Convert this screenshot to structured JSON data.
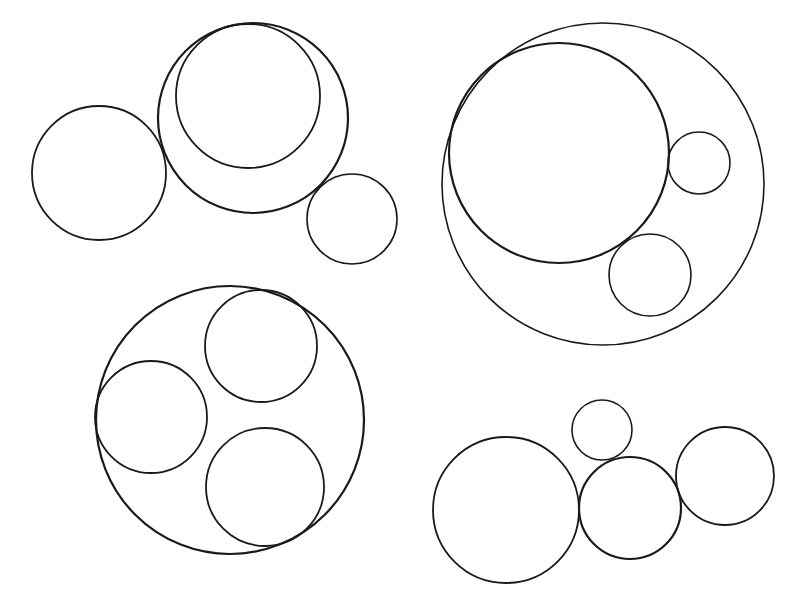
{
  "diagram": {
    "background": "#ffffff",
    "stroke_color": "#1a1a1a",
    "groups": [
      {
        "name": "group-top-left",
        "circles": [
          {
            "name": "large-circle",
            "cx": 253,
            "cy": 118,
            "r": 95,
            "w": 2.2
          },
          {
            "name": "inner-circle",
            "cx": 248,
            "cy": 96,
            "r": 72,
            "w": 1.8
          },
          {
            "name": "left-circle",
            "cx": 99,
            "cy": 173,
            "r": 67,
            "w": 1.8
          },
          {
            "name": "small-circle",
            "cx": 352,
            "cy": 219,
            "r": 45,
            "w": 1.6
          }
        ]
      },
      {
        "name": "group-top-right",
        "circles": [
          {
            "name": "outer-circle",
            "cx": 603,
            "cy": 184,
            "r": 161,
            "w": 1.6
          },
          {
            "name": "large-inner-circle",
            "cx": 559,
            "cy": 153,
            "r": 110,
            "w": 2.2
          },
          {
            "name": "small-circle-right",
            "cx": 699,
            "cy": 163,
            "r": 31,
            "w": 1.6
          },
          {
            "name": "small-circle-bottom",
            "cx": 650,
            "cy": 275,
            "r": 41,
            "w": 1.6
          }
        ]
      },
      {
        "name": "group-bottom-left",
        "circles": [
          {
            "name": "outer-circle",
            "cx": 230,
            "cy": 420,
            "r": 134,
            "w": 2.2
          },
          {
            "name": "inner-circle-top",
            "cx": 261,
            "cy": 346,
            "r": 56,
            "w": 1.8
          },
          {
            "name": "inner-circle-left",
            "cx": 151,
            "cy": 417,
            "r": 56,
            "w": 1.8
          },
          {
            "name": "inner-circle-bottom",
            "cx": 265,
            "cy": 487,
            "r": 59,
            "w": 1.8
          }
        ]
      },
      {
        "name": "group-bottom-right",
        "circles": [
          {
            "name": "large-circle",
            "cx": 506,
            "cy": 510,
            "r": 73,
            "w": 1.8
          },
          {
            "name": "small-circle-top",
            "cx": 602,
            "cy": 430,
            "r": 30,
            "w": 1.6
          },
          {
            "name": "middle-circle",
            "cx": 630,
            "cy": 508,
            "r": 51,
            "w": 2.2
          },
          {
            "name": "right-circle",
            "cx": 725,
            "cy": 476,
            "r": 49,
            "w": 1.8
          }
        ]
      }
    ]
  }
}
